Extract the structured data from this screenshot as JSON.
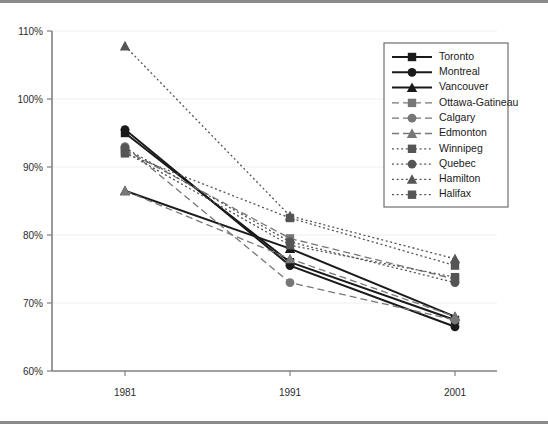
{
  "chart_data": {
    "type": "line",
    "title": "",
    "subtitle": "",
    "xlabel": "",
    "ylabel": "",
    "x": [
      "1981",
      "1991",
      "2001"
    ],
    "categories": [
      "1981",
      "1991",
      "2001"
    ],
    "ylim": [
      60,
      110
    ],
    "y_ticks": [
      "60%",
      "70%",
      "80%",
      "90%",
      "100%",
      "110%"
    ],
    "y_tick_values": [
      60,
      70,
      80,
      90,
      100,
      110
    ],
    "grid": true,
    "legend_position": "top-right",
    "series": [
      {
        "name": "Toronto",
        "values": [
          95.0,
          76.0,
          67.5
        ],
        "marker": "square",
        "dash": "solid",
        "color": "#1a1a1a"
      },
      {
        "name": "Montreal",
        "values": [
          95.5,
          75.5,
          66.5
        ],
        "marker": "circle",
        "dash": "solid",
        "color": "#1a1a1a"
      },
      {
        "name": "Vancouver",
        "values": [
          86.5,
          78.0,
          68.0
        ],
        "marker": "triangle",
        "dash": "solid",
        "color": "#1a1a1a"
      },
      {
        "name": "Ottawa-Gatineau",
        "values": [
          92.5,
          79.5,
          73.5
        ],
        "marker": "square",
        "dash": "dashed",
        "color": "#777777"
      },
      {
        "name": "Calgary",
        "values": [
          93.0,
          73.0,
          67.5
        ],
        "marker": "circle",
        "dash": "dashed",
        "color": "#777777"
      },
      {
        "name": "Edmonton",
        "values": [
          86.5,
          76.5,
          68.0
        ],
        "marker": "triangle",
        "dash": "dashed",
        "color": "#777777"
      },
      {
        "name": "Winnipeg",
        "values": [
          92.0,
          82.5,
          75.5
        ],
        "marker": "square",
        "dash": "dotted",
        "color": "#555555"
      },
      {
        "name": "Quebec",
        "values": [
          92.8,
          79.0,
          73.0
        ],
        "marker": "circle",
        "dash": "dotted",
        "color": "#555555"
      },
      {
        "name": "Hamilton",
        "values": [
          107.8,
          82.8,
          76.5
        ],
        "marker": "triangle",
        "dash": "dotted",
        "color": "#555555"
      },
      {
        "name": "Halifax",
        "values": [
          92.2,
          78.5,
          73.8
        ],
        "marker": "square",
        "dash": "dotted",
        "color": "#555555"
      }
    ]
  },
  "legend": {
    "entries": [
      "Toronto",
      "Montreal",
      "Vancouver",
      "Ottawa-Gatineau",
      "Calgary",
      "Edmonton",
      "Winnipeg",
      "Quebec",
      "Hamilton",
      "Halifax"
    ]
  },
  "axes": {
    "y_labels": [
      "110%",
      "100%",
      "90%",
      "80%",
      "70%",
      "60%"
    ],
    "x_labels": [
      "1981",
      "1991",
      "2001"
    ]
  },
  "colors": {
    "solid": "#1a1a1a",
    "dashed": "#777777",
    "dotted": "#555555",
    "axis": "#808080",
    "grid": "#eeeeee",
    "frame": "#8a8a8a"
  }
}
